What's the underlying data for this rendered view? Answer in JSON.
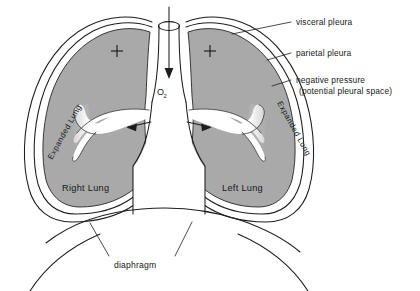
{
  "figure": {
    "background_color": "#ffffff",
    "lung_fill_color": "#a9a9a9",
    "line_color": "#1b1d1f",
    "text_color": "#16181a"
  },
  "callouts": {
    "visceral_pleura": "visceral pleura",
    "parietal_pleura": "parietal pleura",
    "negative_pressure_line1": "negative pressure",
    "negative_pressure_line2": "(potential pleural space)",
    "diaphragm": "diaphragm"
  },
  "lungs": {
    "right_label": "Right Lung",
    "left_label": "Left Lung",
    "right_state_label": "Expanded Lung",
    "left_state_label": "Expanded Lung",
    "right_pressure_symbol": "+",
    "left_pressure_symbol": "+"
  },
  "airway": {
    "gas_label": "O",
    "gas_subscript": "2",
    "flow_direction": "downward-then-bilateral"
  },
  "icons": {
    "inflow_arrow": "down-arrow-icon",
    "right_branch_arrow": "left-arrow-icon",
    "left_branch_arrow": "right-arrow-icon",
    "positive_pressure": "plus-icon"
  }
}
